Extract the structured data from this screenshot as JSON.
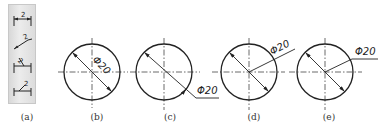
{
  "figure": {
    "panels": [
      {
        "id": "a",
        "caption": "(a)",
        "center_x": 27,
        "kind": "toolbar"
      },
      {
        "id": "b",
        "caption": "(b)",
        "center_x": 97,
        "kind": "diameter-inside",
        "dimension_text": "Φ20",
        "circle": {
          "cx": 92,
          "cy": 72,
          "r": 28
        }
      },
      {
        "id": "c",
        "caption": "(c)",
        "center_x": 170,
        "kind": "diameter-outside-leader",
        "dimension_text": "Φ20",
        "circle": {
          "cx": 164,
          "cy": 72,
          "r": 28
        }
      },
      {
        "id": "d",
        "caption": "(d)",
        "center_x": 254,
        "kind": "diameter-inclined-leader",
        "dimension_text": "Φ20",
        "circle": {
          "cx": 249,
          "cy": 72,
          "r": 28
        }
      },
      {
        "id": "e",
        "caption": "(e)",
        "center_x": 329,
        "kind": "diameter-bent-leader",
        "dimension_text": "Φ20",
        "circle": {
          "cx": 325,
          "cy": 72,
          "r": 28
        }
      }
    ],
    "toolbar": {
      "buttons": [
        {
          "name": "linear-dimension-icon",
          "value": "2"
        },
        {
          "name": "aligned-dimension-icon",
          "value": "2"
        },
        {
          "name": "angled-text-dimension-icon",
          "value": "2"
        },
        {
          "name": "leader-dimension-icon",
          "value": "2"
        }
      ]
    },
    "colors": {
      "line": "#222222",
      "centerline": "#444444",
      "toolbar_bg": "#e2e2e2"
    }
  }
}
